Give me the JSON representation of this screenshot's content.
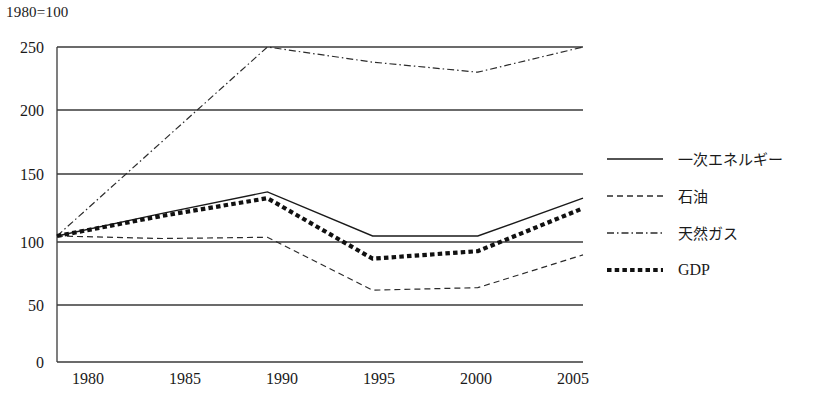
{
  "chart_title": "1980=100",
  "axes": {
    "y_ticks": [
      "0",
      "50",
      "100",
      "150",
      "200",
      "250"
    ],
    "x_ticks": [
      "1980",
      "1985",
      "1990",
      "1995",
      "2000",
      "2005"
    ]
  },
  "legend": {
    "items": [
      {
        "label": "一次エネルギー",
        "style": "solid",
        "icon": "solid-line-icon"
      },
      {
        "label": "石油",
        "style": "dashed",
        "icon": "dashed-line-icon"
      },
      {
        "label": "天然ガス",
        "style": "dash-dot",
        "icon": "dash-dot-line-icon"
      },
      {
        "label": "GDP",
        "style": "thick-dotted",
        "icon": "thick-dotted-line-icon"
      }
    ]
  },
  "chart_data": {
    "type": "line",
    "title": "1980=100",
    "xlabel": "",
    "ylabel": "",
    "x": [
      1980,
      1985,
      1990,
      1995,
      2000,
      2005
    ],
    "categories": [
      "1980",
      "1985",
      "1990",
      "1995",
      "2000",
      "2005"
    ],
    "xlim": [
      1980,
      2005
    ],
    "ylim": [
      0,
      250
    ],
    "y_ticks": [
      0,
      50,
      100,
      150,
      200,
      250
    ],
    "grid": "horizontal",
    "legend_position": "right",
    "series": [
      {
        "name": "一次エネルギー",
        "style": "solid",
        "values": [
          100,
          118,
          135,
          100,
          100,
          130
        ]
      },
      {
        "name": "石油",
        "style": "dashed",
        "values": [
          100,
          98,
          99,
          57,
          59,
          85
        ]
      },
      {
        "name": "天然ガス",
        "style": "dash-dot",
        "values": [
          100,
          175,
          250,
          238,
          230,
          250
        ]
      },
      {
        "name": "GDP",
        "style": "thick-dotted",
        "values": [
          100,
          116,
          130,
          82,
          88,
          122
        ]
      }
    ]
  }
}
